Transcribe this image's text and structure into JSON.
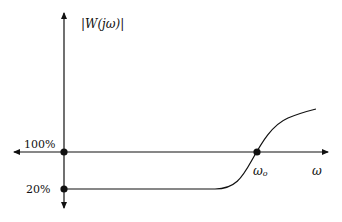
{
  "diagram": {
    "y_axis_label": "|W(jω)|",
    "x_axis_label": "ω",
    "levels": [
      {
        "label": "100%"
      },
      {
        "label": "20%"
      }
    ],
    "crossover_label": "ωo",
    "crossover_sub": "o",
    "crossover_main": "ω",
    "colors": {
      "line": "#111111",
      "background": "#ffffff"
    }
  }
}
